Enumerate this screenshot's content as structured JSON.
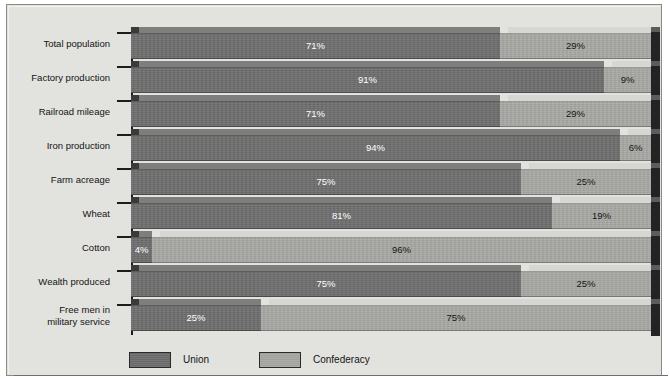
{
  "figure": {
    "axis_label_area_width_px": 104,
    "legend": {
      "items": [
        {
          "label": "Union",
          "swatch_name": "legend-swatch-union",
          "color": "#6e6e6e"
        },
        {
          "label": "Confederacy",
          "swatch_name": "legend-swatch-confederacy",
          "color": "#a8a8a4"
        }
      ]
    },
    "colors": {
      "union": "#6e6e6e",
      "confederacy": "#a8a8a4",
      "end_cap": "#232323",
      "plate_background": "#e2e2de",
      "axis": "#1c1c1c",
      "label_text": "#141414",
      "union_label_text": "#ffffff",
      "confederacy_label_text": "#161616"
    }
  },
  "chart_data": {
    "type": "bar",
    "orientation": "horizontal",
    "stacked": true,
    "normalized_to_percent": true,
    "title": "",
    "subtitle": "",
    "xlabel": "",
    "ylabel": "",
    "xlim": [
      0,
      100
    ],
    "grid": false,
    "legend_position": "bottom",
    "value_suffix": "%",
    "categories": [
      "Total population",
      "Factory production",
      "Railroad mileage",
      "Iron production",
      "Farm acreage",
      "Wheat",
      "Cotton",
      "Wealth produced",
      "Free men in\nmilitary service"
    ],
    "series": [
      {
        "name": "Union",
        "values": [
          71,
          91,
          71,
          94,
          75,
          81,
          4,
          75,
          25
        ],
        "labels": [
          "71%",
          "91%",
          "71%",
          "94%",
          "75%",
          "81%",
          "4%",
          "75%",
          "25%"
        ]
      },
      {
        "name": "Confederacy",
        "values": [
          29,
          9,
          29,
          6,
          25,
          19,
          96,
          25,
          75
        ],
        "labels": [
          "29%",
          "9%",
          "29%",
          "6%",
          "25%",
          "19%",
          "96%",
          "25%",
          "75%"
        ]
      }
    ]
  }
}
